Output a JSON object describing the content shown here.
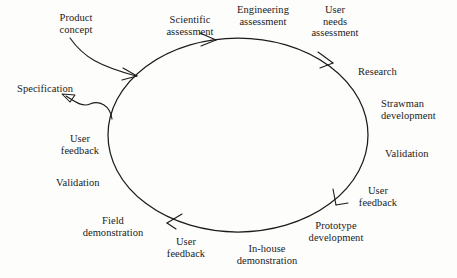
{
  "diagram": {
    "type": "cycle-diagram",
    "background_color": "#fdfdfb",
    "stroke_color": "#1b1b1b",
    "text_color": "#1b1b1b",
    "cycle": {
      "shape": "ellipse",
      "center_x": 238,
      "center_y": 135,
      "radius_x": 130,
      "radius_y": 97,
      "direction": "clockwise"
    },
    "labels": {
      "product_concept": "Product\nconcept",
      "scientific_assessment": "Scientific\nassessment",
      "engineering_assessment": "Engineering\nassessment",
      "user_needs_assessment": "User\nneeds\nassessment",
      "research": "Research",
      "strawman_development": "Strawman\ndevelopment",
      "validation_right": "Validation",
      "user_feedback_right": "User\nfeedback",
      "prototype_development": "Prototype\ndevelopment",
      "in_house_demonstration": "In-house\ndemonstration",
      "user_feedback_bottom": "User\nfeedback",
      "field_demonstration": "Field\ndemonstration",
      "validation_left": "Validation",
      "user_feedback_left": "User\nfeedback",
      "specification": "Specification"
    },
    "stages": [
      "Scientific assessment",
      "Engineering assessment",
      "User needs assessment",
      "Research",
      "Strawman development",
      "Validation",
      "User feedback",
      "Prototype development",
      "In-house demonstration",
      "User feedback",
      "Field demonstration",
      "Validation",
      "User feedback"
    ],
    "inputs": [
      "Product concept"
    ],
    "outputs": [
      "Specification"
    ]
  }
}
